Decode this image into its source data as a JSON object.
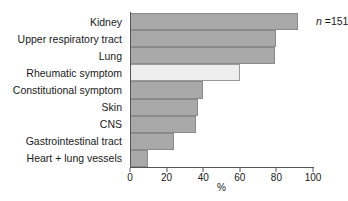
{
  "chart_data": {
    "type": "bar",
    "orientation": "horizontal",
    "title": "",
    "subtitle": "",
    "xlabel": "%",
    "ylabel": "",
    "xlim": [
      0,
      100
    ],
    "xticks": [
      0,
      20,
      40,
      60,
      80,
      100
    ],
    "xtick_labels": [
      "0",
      "20",
      "40",
      "60",
      "80",
      "100"
    ],
    "grid": false,
    "legend": null,
    "categories": [
      "Kidney",
      "Upper respiratory tract",
      "Lung",
      "Rheumatic symptom",
      "Constitutional symptom",
      "Skin",
      "CNS",
      "Gastrointestinal  tract",
      "Heart + lung vessels"
    ],
    "values": [
      92,
      80,
      79,
      60,
      40,
      37,
      36,
      24,
      10
    ],
    "bar_colors": [
      "#a9a9a9",
      "#a9a9a9",
      "#a9a9a9",
      "#ededed",
      "#a9a9a9",
      "#a9a9a9",
      "#a9a9a9",
      "#a9a9a9",
      "#a9a9a9"
    ],
    "highlight_index": 3,
    "annotations": [
      {
        "text": "n =151",
        "italic_prefix": "n",
        "rest": " =151"
      }
    ]
  },
  "annotation": {
    "n_symbol": "n",
    "n_value": " =151"
  },
  "colors": {
    "bar_fill": "#a9a9a9",
    "bar_highlight": "#ededed",
    "bar_border": "#8a8a8a",
    "axis": "#555555",
    "text": "#1a1a1a",
    "background": "#ffffff"
  }
}
